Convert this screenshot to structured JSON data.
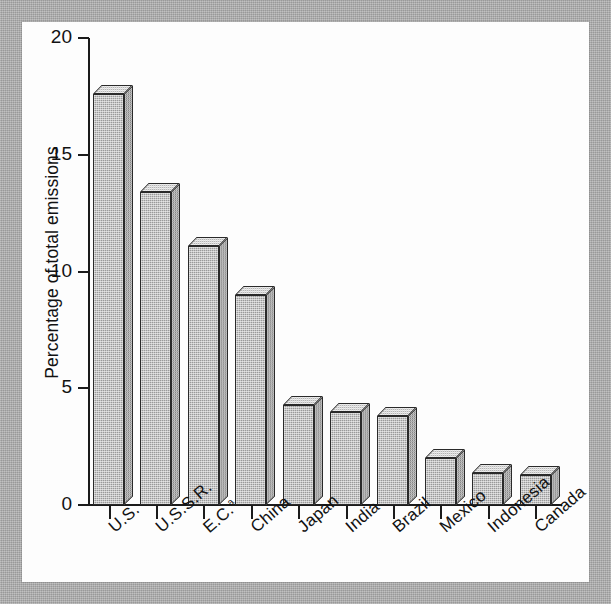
{
  "chart_data": {
    "type": "bar",
    "title": "",
    "xlabel": "",
    "ylabel": "Percentage of total emissions",
    "ylim": [
      0,
      20
    ],
    "yticks": [
      0,
      5,
      10,
      15,
      20
    ],
    "ytick_labels": [
      "0",
      "5",
      "10",
      "15",
      "20"
    ],
    "grid": false,
    "legend": "none",
    "categories": [
      "U.S.",
      "U.S.S.R.",
      "E.C.",
      "China",
      "Japan",
      "India",
      "Brazil",
      "Mexico",
      "Indonesia",
      "Canada"
    ],
    "category_labels": [
      "U.S.",
      "U.S.S.R.",
      "E.C.",
      "China",
      "Japan",
      "India",
      "Brazil",
      "Mexico",
      "Indonesia",
      "Canada"
    ],
    "category_footnotes": [
      "",
      "",
      "a",
      "",
      "",
      "",
      "",
      "",
      "",
      ""
    ],
    "values": [
      17.6,
      13.4,
      11.1,
      9.0,
      4.3,
      4.0,
      3.8,
      2.0,
      1.35,
      1.3
    ],
    "bar_style": "3d-isometric",
    "bar_fill_color": "#9a9a9a",
    "bar_top_color": "#b4b4b4",
    "bar_side_color": "#868686",
    "bar_outline_color": "#2a2a2a",
    "axis_color": "#1b1b1b",
    "plot_background": "#fdfdfd",
    "page_border_color": "#a9a9a9"
  }
}
